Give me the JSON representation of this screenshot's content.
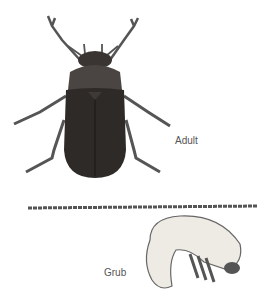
{
  "figure": {
    "labels": {
      "adult": "Adult",
      "grub": "Grub"
    },
    "subjects": [
      "beetle-adult",
      "beetle-grub"
    ],
    "colors": {
      "body_dark": "#2e2a28",
      "pronotum": "#4a4442",
      "legs": "#555",
      "grub_body": "#eeeae4",
      "grub_outline": "#666",
      "soil_line": "#555"
    }
  }
}
